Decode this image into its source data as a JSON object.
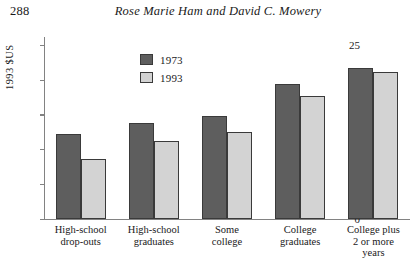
{
  "page": {
    "number": "288",
    "running_head": "Rose Marie Ham and David C. Mowery"
  },
  "chart_data": {
    "type": "bar",
    "title": "",
    "xlabel": "",
    "ylabel": "1993 $US",
    "ylim": [
      0,
      25
    ],
    "yticks": [
      0,
      5,
      10,
      15,
      20,
      25
    ],
    "ytick_labels": [
      "0",
      "5",
      "10",
      "15",
      "20",
      "25"
    ],
    "grid": false,
    "legend_position": "upper-left-inside",
    "categories": [
      "High-school drop-outs",
      "High-school graduates",
      "Some college",
      "College graduates",
      "College plus 2 or more years"
    ],
    "category_lines": [
      [
        "High-school",
        "drop-outs"
      ],
      [
        "High-school",
        "graduates"
      ],
      [
        "Some",
        "college"
      ],
      [
        "College",
        "graduates"
      ],
      [
        "College plus",
        "2 or more",
        "years"
      ]
    ],
    "series": [
      {
        "name": "1973",
        "color": "#5e5e5e",
        "values": [
          12.2,
          13.7,
          14.7,
          19.4,
          21.7
        ]
      },
      {
        "name": "1993",
        "color": "#d3d3d3",
        "values": [
          8.6,
          11.1,
          12.4,
          17.7,
          21.1
        ]
      }
    ]
  }
}
